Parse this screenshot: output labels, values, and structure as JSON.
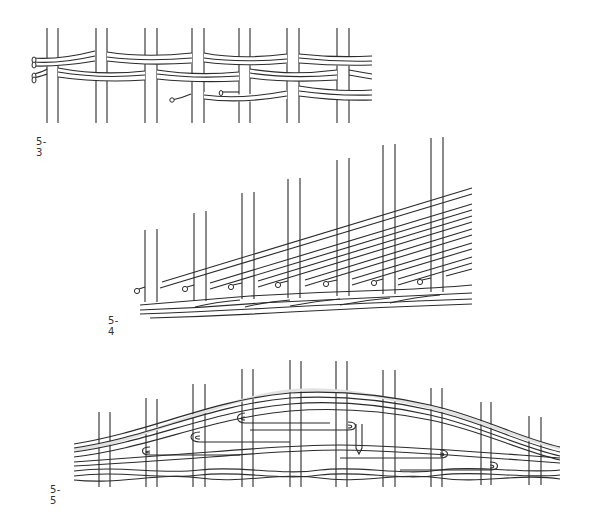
{
  "figures": [
    {
      "id": "5-3",
      "label": "5-3",
      "description": "Weaving with paired weavers over paired stakes"
    },
    {
      "id": "5-4",
      "label": "5-4",
      "description": "Diagonal weavers rising across stakes of increasing height, with rod ends at base"
    },
    {
      "id": "5-5",
      "label": "5-5",
      "description": "Arched multi-strand weaving with looped weaver turns"
    }
  ],
  "colors": {
    "line": "#2b2b2b",
    "background": "#ffffff",
    "shadow": "#e2e2e2"
  }
}
